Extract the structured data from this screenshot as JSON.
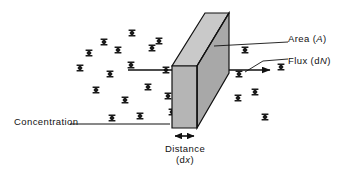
{
  "figure": {
    "background_color": "#ffffff",
    "line_color": "#111111",
    "slab_fill_front": "#b3b3b3",
    "slab_fill_top": "#c9c9c9",
    "slab_fill_side": "#a6a6a6"
  },
  "labels": {
    "area": {
      "text": "Area",
      "symbol": "A",
      "open_paren": "(",
      "close_paren": ")"
    },
    "flux": {
      "text": "Flux",
      "symbol_prefix": "d",
      "symbol": "N",
      "open_paren": "(",
      "close_paren": ")"
    },
    "concentration": {
      "text": "Concentration"
    },
    "distance": {
      "text": "Distance",
      "symbol_prefix": "d",
      "symbol": "x",
      "open_paren": "(",
      "close_paren": ")"
    }
  },
  "icons": {
    "molecule": "molecule-glyph",
    "flux_arrow": "right-arrow-icon",
    "distance_arrow": "double-headed-arrow-icon"
  },
  "geometry": {
    "front_face": [
      [
        172,
        66
      ],
      [
        197,
        66
      ],
      [
        197,
        128
      ],
      [
        172,
        128
      ]
    ],
    "top_face": [
      [
        172,
        66
      ],
      [
        197,
        66
      ],
      [
        229,
        13
      ],
      [
        205,
        13
      ]
    ],
    "side_face": [
      [
        197,
        66
      ],
      [
        229,
        13
      ],
      [
        229,
        73
      ],
      [
        197,
        128
      ]
    ],
    "concentration_line": [
      [
        70,
        124
      ],
      [
        170,
        124
      ]
    ],
    "flux_line": [
      [
        128,
        70
      ],
      [
        277,
        70
      ]
    ],
    "area_leader": [
      [
        213,
        46
      ],
      [
        288,
        42
      ]
    ],
    "flux_leader": [
      [
        245,
        70
      ],
      [
        262,
        62
      ],
      [
        288,
        60
      ]
    ],
    "distance_arrow": [
      [
        173,
        136
      ],
      [
        196,
        136
      ]
    ]
  },
  "molecules": {
    "count": 23,
    "positions": [
      [
        104,
        42
      ],
      [
        132,
        33
      ],
      [
        152,
        48
      ],
      [
        89,
        53
      ],
      [
        131,
        65
      ],
      [
        110,
        74
      ],
      [
        96,
        90
      ],
      [
        125,
        100
      ],
      [
        148,
        87
      ],
      [
        140,
        116
      ],
      [
        112,
        118
      ],
      [
        159,
        41
      ],
      [
        166,
        70
      ],
      [
        168,
        96
      ],
      [
        172,
        112
      ],
      [
        245,
        50
      ],
      [
        239,
        74
      ],
      [
        255,
        92
      ],
      [
        238,
        98
      ],
      [
        265,
        117
      ],
      [
        281,
        67
      ],
      [
        80,
        68
      ],
      [
        118,
        50
      ]
    ]
  }
}
